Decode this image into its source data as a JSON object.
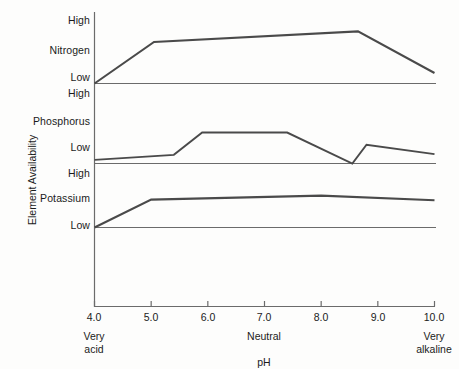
{
  "chart_data": {
    "type": "line",
    "title": "",
    "xlabel": "pH",
    "ylabel": "Element Availability",
    "xlim": [
      4.0,
      10.0
    ],
    "grid": false,
    "legend_position": "none",
    "x_ticks": [
      "4.0",
      "5.0",
      "6.0",
      "7.0",
      "8.0",
      "9.0",
      "10.0"
    ],
    "x_tick_values": [
      4.0,
      5.0,
      6.0,
      7.0,
      8.0,
      9.0,
      10.0
    ],
    "x_annotations": [
      {
        "label": "Very acid",
        "line1": "Very",
        "line2": "acid",
        "at": 4.0
      },
      {
        "label": "Neutral",
        "line1": "Neutral",
        "line2": "",
        "at": 7.0
      },
      {
        "label": "Very alkaline",
        "line1": "Very",
        "line2": "alkaline",
        "at": 10.0
      }
    ],
    "panels": [
      {
        "name": "Nitrogen",
        "y_ticks": [
          "High",
          "Low"
        ],
        "y_axis_labels": {
          "high": "High",
          "mid": "Nitrogen",
          "low": "Low"
        },
        "points": [
          {
            "x": 4.0,
            "y": 0.0
          },
          {
            "x": 5.05,
            "y": 0.67
          },
          {
            "x": 8.65,
            "y": 0.84
          },
          {
            "x": 10.0,
            "y": 0.17
          }
        ]
      },
      {
        "name": "Phosphorus",
        "y_ticks": [
          "High",
          "Low"
        ],
        "y_axis_labels": {
          "high": "High",
          "mid": "Phosphorus",
          "low": "Low"
        },
        "points": [
          {
            "x": 4.0,
            "y": 0.05
          },
          {
            "x": 5.4,
            "y": 0.12
          },
          {
            "x": 5.9,
            "y": 0.43
          },
          {
            "x": 7.4,
            "y": 0.43
          },
          {
            "x": 8.55,
            "y": 0.0
          },
          {
            "x": 8.8,
            "y": 0.26
          },
          {
            "x": 10.0,
            "y": 0.13
          }
        ]
      },
      {
        "name": "Potassium",
        "y_ticks": [
          "High",
          "Low"
        ],
        "y_axis_labels": {
          "high": "High",
          "mid": "Potassium",
          "low": "Low"
        },
        "points": [
          {
            "x": 4.0,
            "y": 0.0
          },
          {
            "x": 5.0,
            "y": 0.48
          },
          {
            "x": 8.0,
            "y": 0.55
          },
          {
            "x": 10.0,
            "y": 0.47
          }
        ]
      }
    ],
    "series_color": "#4a4a4a",
    "axis_color": "#6b6b6b"
  },
  "axis": {
    "y_title": "Element Availability",
    "x_title": "pH"
  },
  "panel_labels": {
    "nitrogen": {
      "high": "High",
      "name": "Nitrogen",
      "low": "Low"
    },
    "phosphorus": {
      "high": "High",
      "name": "Phosphorus",
      "low": "Low"
    },
    "potassium": {
      "high": "High",
      "name": "Potassium",
      "low": "Low"
    }
  },
  "x_ticks": {
    "t0": "4.0",
    "t1": "5.0",
    "t2": "6.0",
    "t3": "7.0",
    "t4": "8.0",
    "t5": "9.0",
    "t6": "10.0"
  },
  "x_captions": {
    "very_acid_1": "Very",
    "very_acid_2": "acid",
    "neutral": "Neutral",
    "very_alkaline_1": "Very",
    "very_alkaline_2": "alkaline"
  },
  "colors": {
    "background": "#fdfdfc",
    "series": "#4a4a4a",
    "axis": "#6b6b6b",
    "text": "#1b1b1b"
  }
}
